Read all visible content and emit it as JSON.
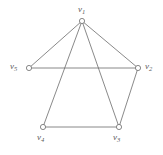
{
  "figure": {
    "name": "undirected-graph-diagram",
    "background_color": "#ffffff",
    "stroke_color": "#6b6b6b",
    "vertex_fill_color": "#ffffff",
    "label_color": "#5a5a5a"
  },
  "graph_data": {
    "type": "graph",
    "directed": false,
    "vertex_count": 5,
    "edge_count": 7,
    "vertices": [
      {
        "id": "v1",
        "label": "v",
        "subscript": "1",
        "x": 82,
        "y": 21,
        "label_x": 78,
        "label_y": 5
      },
      {
        "id": "v2",
        "label": "v",
        "subscript": "2",
        "x": 138,
        "y": 68,
        "label_x": 145,
        "label_y": 62
      },
      {
        "id": "v3",
        "label": "v",
        "subscript": "3",
        "x": 119,
        "y": 127,
        "label_x": 113,
        "label_y": 133
      },
      {
        "id": "v4",
        "label": "v",
        "subscript": "4",
        "x": 43,
        "y": 127,
        "label_x": 37,
        "label_y": 133
      },
      {
        "id": "v5",
        "label": "v",
        "subscript": "5",
        "x": 29,
        "y": 68,
        "label_x": 10,
        "label_y": 62
      }
    ],
    "edges": [
      {
        "from": "v1",
        "to": "v5"
      },
      {
        "from": "v1",
        "to": "v2"
      },
      {
        "from": "v1",
        "to": "v3"
      },
      {
        "from": "v1",
        "to": "v4"
      },
      {
        "from": "v5",
        "to": "v2"
      },
      {
        "from": "v2",
        "to": "v3"
      },
      {
        "from": "v4",
        "to": "v3"
      }
    ],
    "vertex_radius": 2.6,
    "line_width": 0.8
  }
}
